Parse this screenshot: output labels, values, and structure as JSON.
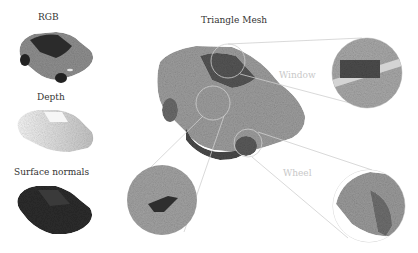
{
  "figure": {
    "panels": [
      {
        "id": "rgb",
        "label": "RGB"
      },
      {
        "id": "depth",
        "label": "Depth"
      },
      {
        "id": "normals",
        "label": "Surface normals"
      }
    ],
    "main": {
      "label": "Triangle Mesh"
    },
    "callouts": [
      {
        "id": "window",
        "label": "Window"
      },
      {
        "id": "side",
        "label": ""
      },
      {
        "id": "wheel",
        "label": "Wheel"
      }
    ],
    "colors": {
      "background": "#ffffff",
      "car_rgb": "#8a8a8a",
      "car_rgb_glass": "#2b2b2b",
      "depth_light": "#eeeeee",
      "depth_mid": "#c9c9c9",
      "normals": "#2a2a2a",
      "mesh": "#9a9a9a",
      "mesh_dark": "#555555",
      "callout_line": "#c8c8c8"
    }
  }
}
